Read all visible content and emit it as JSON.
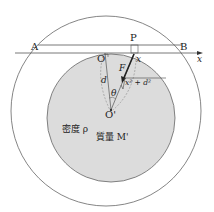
{
  "labels": {
    "A": "A",
    "B": "B",
    "P": "P",
    "O": "O",
    "O_prime": "O'",
    "x_axis": "x",
    "x_point": "x",
    "d": "d",
    "theta": "θ",
    "F": "F",
    "hyp": "x² + d²",
    "density": "密度 ρ",
    "mass": "質量 M'"
  },
  "colors": {
    "inner_fill": "#dcdcdc",
    "stroke": "#555555",
    "arrow": "#222222"
  }
}
